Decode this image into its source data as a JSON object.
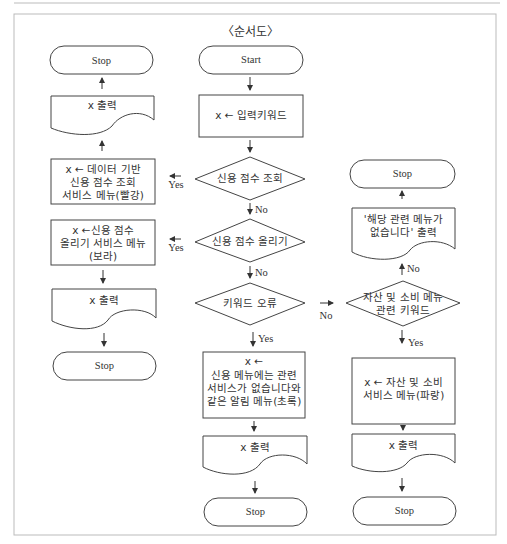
{
  "diagram": {
    "title": "〈순서도〉",
    "nodes": {
      "start": "Start",
      "input": "x ← 입력키워드",
      "decision_credit_check": "신용 점수 조회",
      "decision_credit_raise": "신용 점수 올리기",
      "decision_keyword_error": "키워드 오류",
      "decision_asset": "자산 및 소비 메뉴\n관련 키워드",
      "proc_red": "x ← 데이터 기반\n신용 점수 조회\n서비스 메뉴(빨강)",
      "proc_purple": "x ←신용 점수\n올리기 서비스 메뉴\n(보라)",
      "proc_green_x": "x ←",
      "proc_green": "신용 메뉴에는 관련\n서비스가 없습니다와\n같은 알림 메뉴(초록)",
      "proc_blue": "x ← 자산 및 소비\n서비스 메뉴(파랑)",
      "out_left_top": "x 출력",
      "out_left_bottom": "x 출력",
      "out_mid": "x 출력",
      "out_right": "x 출력",
      "out_none": "'해당 관련 메뉴가\n없습니다' 출력",
      "stop_left_top": "Stop",
      "stop_left_bottom": "Stop",
      "stop_mid": "Stop",
      "stop_right_top": "Stop",
      "stop_right_bottom": "Stop"
    },
    "edges": {
      "yes1": "Yes",
      "yes2": "Yes",
      "no1": "No",
      "no2": "No",
      "no3": "No",
      "no4": "No",
      "yes3": "Yes",
      "yes4": "Yes"
    }
  }
}
